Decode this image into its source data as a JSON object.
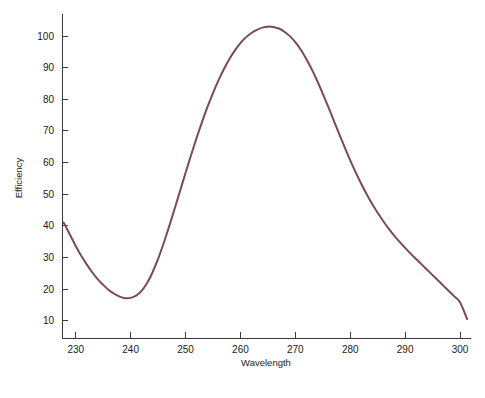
{
  "chart_data": {
    "type": "line",
    "title": "",
    "subtitle": "",
    "xlabel": "Wavelength",
    "ylabel": "Efficiency",
    "xlim": [
      227.5,
      302.0
    ],
    "ylim": [
      4.5,
      107.0
    ],
    "xticks": [
      230,
      240,
      250,
      260,
      270,
      280,
      290,
      300
    ],
    "yticks": [
      10,
      20,
      30,
      40,
      50,
      60,
      70,
      80,
      90,
      100
    ],
    "xtick_labels": [
      "230",
      "240",
      "250",
      "260",
      "270",
      "280",
      "290",
      "300"
    ],
    "ytick_labels": [
      "10",
      "20",
      "30",
      "40",
      "50",
      "60",
      "70",
      "80",
      "90",
      "100"
    ],
    "grid": false,
    "legend": false,
    "legend_position": "none",
    "line_color": "#7a4a58",
    "line_width": 2,
    "background_color": "#ffffff",
    "axis_color": "#3b3b3b",
    "annotations": [],
    "series": [
      {
        "name": "Efficiency vs Wavelength",
        "color": "#7a4a58",
        "x": [
          227.8,
          229,
          230,
          231,
          232,
          233,
          234,
          235,
          236,
          237,
          238,
          239,
          240,
          241,
          242,
          243,
          244,
          245,
          246,
          247,
          248,
          249,
          250,
          251,
          252,
          253,
          254,
          255,
          256,
          257,
          258,
          259,
          260,
          261,
          262,
          263,
          264,
          265,
          266,
          267,
          268,
          269,
          270,
          271,
          272,
          273,
          274,
          275,
          276,
          277,
          278,
          279,
          280,
          281,
          282,
          283,
          284,
          285,
          286,
          287,
          288,
          289,
          290,
          291,
          292,
          293,
          294,
          295,
          296,
          297,
          298,
          299,
          300,
          301.3
        ],
        "y": [
          41.0,
          37.0,
          33.6,
          30.5,
          27.8,
          25.3,
          23.1,
          21.3,
          19.7,
          18.5,
          17.6,
          17.1,
          17.2,
          17.9,
          19.4,
          21.9,
          25.3,
          29.5,
          34.4,
          39.7,
          45.3,
          51.0,
          56.7,
          62.3,
          67.7,
          72.8,
          77.6,
          82.0,
          86.0,
          89.6,
          92.8,
          95.5,
          97.8,
          99.6,
          101.0,
          102.0,
          102.7,
          103.0,
          102.9,
          102.4,
          101.4,
          100.0,
          98.1,
          95.7,
          92.8,
          89.5,
          85.8,
          81.8,
          77.6,
          73.3,
          69.0,
          64.8,
          60.7,
          56.9,
          53.3,
          50.0,
          46.9,
          44.1,
          41.5,
          39.1,
          36.9,
          34.9,
          33.0,
          31.2,
          29.5,
          27.8,
          26.1,
          24.4,
          22.7,
          21.0,
          19.3,
          17.6,
          15.8,
          10.5
        ]
      }
    ]
  },
  "axes": {
    "x_title": "Wavelength",
    "y_title": "Efficiency"
  }
}
